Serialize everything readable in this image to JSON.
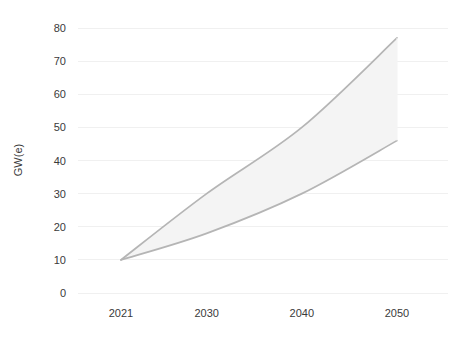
{
  "chart_data": {
    "type": "area",
    "title": "",
    "subtitle": "",
    "xlabel": "",
    "ylabel": "GW(e)",
    "x": [
      2021,
      2030,
      2040,
      2050
    ],
    "categories": [
      "2021",
      "2030",
      "2040",
      "2050"
    ],
    "xtick_labels": [
      "2021",
      "2030",
      "2040",
      "2050"
    ],
    "ytick_labels": [
      "0",
      "10",
      "20",
      "30",
      "40",
      "50",
      "60",
      "70",
      "80"
    ],
    "ytick_values": [
      0,
      10,
      20,
      30,
      40,
      50,
      60,
      70,
      80
    ],
    "ylim": [
      0,
      80
    ],
    "xlim": [
      2021,
      2050
    ],
    "grid": true,
    "grid_axis": "y",
    "legend": false,
    "legend_position": "none",
    "series": [
      {
        "name": "High",
        "values": [
          10,
          30,
          50,
          77
        ]
      },
      {
        "name": "Low",
        "values": [
          10,
          18,
          30,
          46
        ]
      }
    ],
    "band": {
      "upper": [
        10,
        30,
        50,
        77
      ],
      "lower": [
        10,
        18,
        30,
        46
      ],
      "start_point": 10
    },
    "annotations": []
  },
  "style": {
    "background": "#ffffff",
    "grid_color": "#f0f0f0",
    "band_fill": "#f4f4f4",
    "band_stroke": "#b5b5b5",
    "tick_color": "#3a3a3a"
  }
}
